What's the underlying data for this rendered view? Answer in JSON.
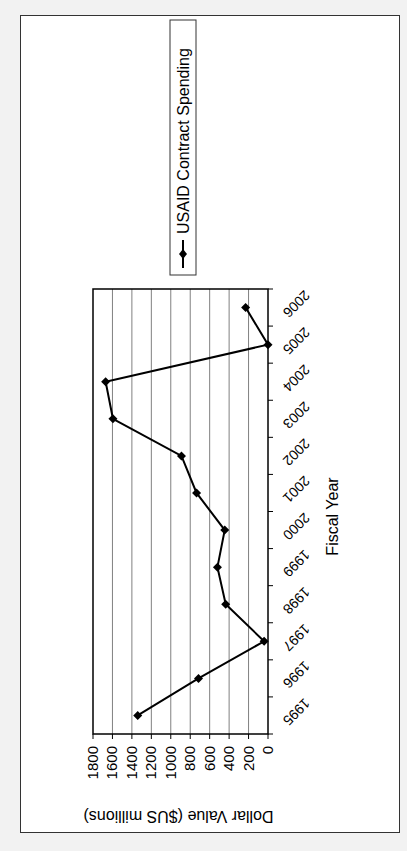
{
  "chart_data": {
    "type": "line",
    "orientation": "rotated-90-clockwise",
    "title": "",
    "xlabel": "Fiscal Year",
    "ylabel": "Dollar Value ($US millions)",
    "categories": [
      "1995",
      "1996",
      "1997",
      "1998",
      "1999",
      "2000",
      "2001",
      "2002",
      "2003",
      "2004",
      "2005",
      "2006"
    ],
    "series": [
      {
        "name": "USAID Contract Spending",
        "values": [
          1340,
          715,
          40,
          435,
          520,
          445,
          735,
          890,
          1595,
          1670,
          0,
          230
        ],
        "color": "#000000",
        "marker": "diamond"
      }
    ],
    "ylim": [
      0,
      1800
    ],
    "yticks": [
      "0",
      "200",
      "400",
      "600",
      "800",
      "1000",
      "1200",
      "1400",
      "1600",
      "1800"
    ],
    "grid": true,
    "legend_position": "right"
  },
  "colors": {
    "page_background": "#f2f2f2",
    "chart_background": "#ffffff",
    "gridline": "#808080",
    "axis": "#000000"
  }
}
